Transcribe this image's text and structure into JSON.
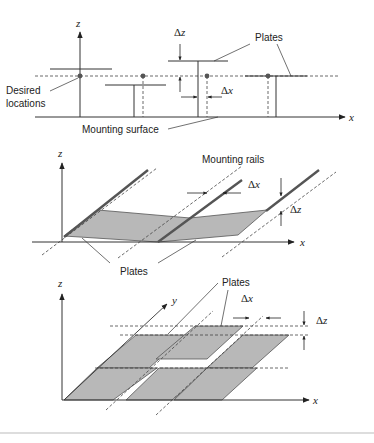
{
  "top_panel": {
    "axis_z": "z",
    "axis_x": "x",
    "label_plates": "Plates",
    "label_desired_1": "Desired",
    "label_desired_2": "locations",
    "label_mounting_surface": "Mounting surface",
    "delta_z": "Δ",
    "delta_z_var": "z",
    "delta_x": "Δ",
    "delta_x_var": "x"
  },
  "middle_panel": {
    "axis_z": "z",
    "axis_x": "x",
    "label_mounting_rails": "Mounting rails",
    "label_plates": "Plates",
    "delta_x": "Δ",
    "delta_x_var": "x",
    "delta_z": "Δ",
    "delta_z_var": "z"
  },
  "bottom_panel": {
    "axis_z": "z",
    "axis_y": "y",
    "axis_x": "x",
    "label_plates": "Plates",
    "delta_x": "Δ",
    "delta_x_var": "x",
    "delta_z": "Δ",
    "delta_z_var": "z"
  },
  "colors": {
    "line": "#333333",
    "plate_fill": "#b8b8b8",
    "rail": "#555555",
    "dot": "#555555"
  }
}
